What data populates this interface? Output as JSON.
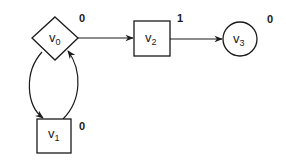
{
  "diagram": {
    "title": "",
    "nodes": [
      {
        "id": "v0",
        "base": "v",
        "sub": "0",
        "shape": "diamond",
        "weight": "0"
      },
      {
        "id": "v1",
        "base": "v",
        "sub": "1",
        "shape": "square",
        "weight": "0"
      },
      {
        "id": "v2",
        "base": "v",
        "sub": "2",
        "shape": "square",
        "weight": "1"
      },
      {
        "id": "v3",
        "base": "v",
        "sub": "3",
        "shape": "circle",
        "weight": "0"
      }
    ],
    "edges": [
      {
        "from": "v0",
        "to": "v2",
        "style": "straight"
      },
      {
        "from": "v2",
        "to": "v3",
        "style": "straight"
      },
      {
        "from": "v0",
        "to": "v1",
        "style": "curved"
      },
      {
        "from": "v1",
        "to": "v0",
        "style": "curved"
      }
    ],
    "colors": {
      "stroke": "#1a1a1a",
      "background": "#ffffff"
    }
  }
}
